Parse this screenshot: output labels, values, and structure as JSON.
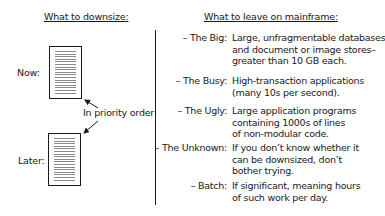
{
  "left": {
    "heading": "What to downsize:",
    "now_label": "Now:",
    "later_label": "Later:",
    "annotation": "In priority order"
  },
  "right": {
    "heading": "What to leave on mainframe:",
    "items": [
      {
        "term": "– The Big:",
        "lines": [
          "Large, unfragmentable databases",
          "and document or image stores–",
          "greater than 10 GB each."
        ]
      },
      {
        "term": "– The Busy:",
        "lines": [
          "High-transaction applications",
          "(many 10s per second)."
        ]
      },
      {
        "term": "– The Ugly:",
        "lines": [
          "Large application programs",
          "containing 1000s of lines",
          "of non-modular code."
        ]
      },
      {
        "term": "– The Unknown:",
        "lines": [
          "If you don’t know whether it",
          "can be downsized, don’t",
          "bother trying."
        ]
      },
      {
        "term": "– Batch:",
        "lines": [
          "If significant, meaning hours",
          "of such work per day."
        ]
      }
    ]
  }
}
